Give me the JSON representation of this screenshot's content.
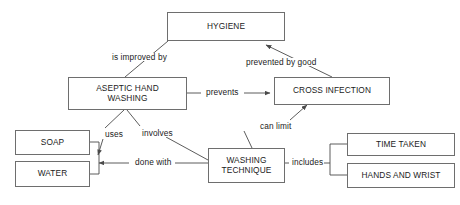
{
  "diagram": {
    "type": "concept-map",
    "canvas": {
      "width": 460,
      "height": 205,
      "background": "#ffffff"
    },
    "style": {
      "node_border": "#6e6e6e",
      "node_fill": "#ffffff",
      "text": "#1b1b1b",
      "edge": "#4a4a4a"
    },
    "nodes": [
      {
        "id": "hygiene",
        "label": "HYGIENE",
        "x": 167,
        "y": 12,
        "w": 118,
        "h": 29
      },
      {
        "id": "aseptic",
        "label": "ASEPTIC HAND\nWASHING",
        "x": 68,
        "y": 77,
        "w": 119,
        "h": 33
      },
      {
        "id": "cross",
        "label": "CROSS INFECTION",
        "x": 274,
        "y": 77,
        "w": 116,
        "h": 28
      },
      {
        "id": "soap",
        "label": "SOAP",
        "x": 15,
        "y": 130,
        "w": 75,
        "h": 25
      },
      {
        "id": "water",
        "label": "WATER",
        "x": 15,
        "y": 161,
        "w": 75,
        "h": 26
      },
      {
        "id": "technique",
        "label": "WASHING\nTECHNIQUE",
        "x": 208,
        "y": 148,
        "w": 77,
        "h": 35
      },
      {
        "id": "time",
        "label": "TIME TAKEN",
        "x": 347,
        "y": 133,
        "w": 108,
        "h": 23
      },
      {
        "id": "hands",
        "label": "HANDS AND WRIST",
        "x": 347,
        "y": 163,
        "w": 108,
        "h": 25
      }
    ],
    "edge_labels": [
      {
        "id": "is-improved-by",
        "text": "is improved by",
        "x": 111,
        "y": 53
      },
      {
        "id": "prevented-by-good",
        "text": "prevented by good",
        "x": 245,
        "y": 58
      },
      {
        "id": "prevents",
        "text": "prevents",
        "x": 205,
        "y": 88
      },
      {
        "id": "uses",
        "text": "uses",
        "x": 104,
        "y": 130
      },
      {
        "id": "involves",
        "text": "involves",
        "x": 141,
        "y": 129
      },
      {
        "id": "can-limit",
        "text": "can limit",
        "x": 259,
        "y": 122
      },
      {
        "id": "done-with",
        "text": "done with",
        "x": 134,
        "y": 162
      },
      {
        "id": "includes",
        "text": "includes",
        "x": 291,
        "y": 157
      }
    ],
    "relations": [
      {
        "from": "aseptic",
        "to": "hygiene",
        "label": "is improved by",
        "arrow": false
      },
      {
        "from": "cross",
        "to": "hygiene",
        "label": "prevented by good",
        "arrow": true
      },
      {
        "from": "aseptic",
        "to": "cross",
        "label": "prevents",
        "arrow": true
      },
      {
        "from": "aseptic",
        "to": "soap",
        "label": "uses",
        "arrow": true
      },
      {
        "from": "aseptic",
        "to": "technique",
        "label": "involves",
        "arrow": false
      },
      {
        "from": "technique",
        "to": "water",
        "label": "done with",
        "arrow": true
      },
      {
        "from": "technique",
        "to": "cross",
        "label": "can limit",
        "arrow": true
      },
      {
        "from": "technique",
        "to": "time",
        "label": "includes",
        "arrow": false
      },
      {
        "from": "technique",
        "to": "hands",
        "label": "includes",
        "arrow": false
      }
    ]
  }
}
